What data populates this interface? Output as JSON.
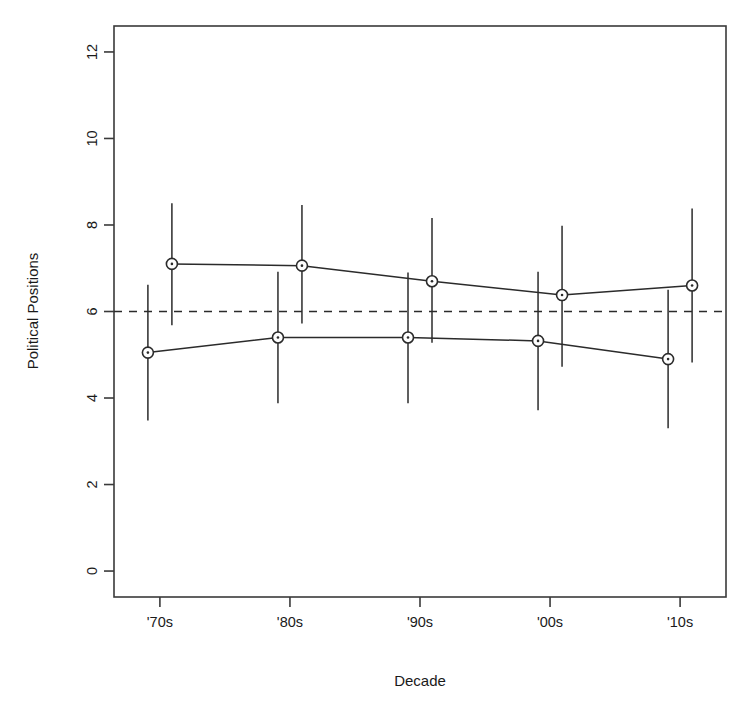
{
  "chart_data": {
    "type": "line",
    "title": "",
    "subtitle": "",
    "xlabel": "Decade",
    "ylabel": "Political Positions",
    "categories": [
      "'70s",
      "'80s",
      "'90s",
      "'00s",
      "'10s"
    ],
    "x_tick_labels": [
      "'70s",
      "'80s",
      "'90s",
      "'00s",
      "'10s"
    ],
    "y_tick_labels": [
      "0",
      "2",
      "4",
      "6",
      "8",
      "10",
      "12"
    ],
    "y_ticks": [
      0,
      2,
      4,
      6,
      8,
      10,
      12
    ],
    "ylim": [
      -0.6,
      12.6
    ],
    "grid": false,
    "legend": "none",
    "marker": "open-circle-with-dot",
    "error_bar_style": "plain-vertical-whisker",
    "reference_line": {
      "orientation": "horizontal",
      "value": 6,
      "style": "dashed",
      "label": ""
    },
    "series": [
      {
        "name": "lower-series",
        "x_offset": -12,
        "values": [
          5.05,
          5.4,
          5.4,
          5.32,
          4.9
        ],
        "err_low": [
          3.48,
          3.88,
          3.88,
          3.72,
          3.3
        ],
        "err_high": [
          6.62,
          6.92,
          6.9,
          6.92,
          6.5
        ]
      },
      {
        "name": "upper-series",
        "x_offset": 12,
        "values": [
          7.1,
          7.06,
          6.7,
          6.38,
          6.6
        ],
        "err_low": [
          5.68,
          5.72,
          5.28,
          4.72,
          4.82
        ],
        "err_high": [
          8.5,
          8.46,
          8.16,
          7.98,
          8.38
        ]
      }
    ]
  },
  "axes": {
    "y_axis_title": "Political Positions",
    "x_axis_title": "Decade"
  }
}
